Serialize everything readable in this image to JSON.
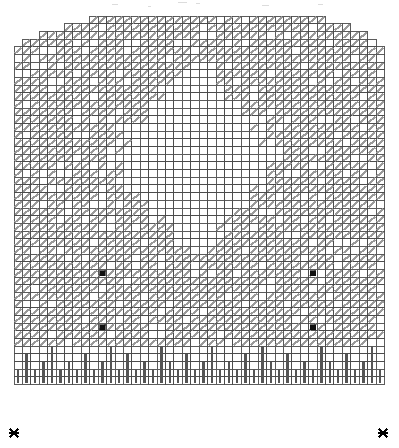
{
  "document": {
    "title": "Knitting Lace Chart",
    "background_color": "#ffffff"
  },
  "legend_symbols": [
    {
      "name": "diagonal-slash",
      "meaning": "slash-symbol",
      "color": "#9a9a9a"
    },
    {
      "name": "black-square",
      "meaning": "filled-marker",
      "color": "#111111"
    },
    {
      "name": "vertical-bar",
      "meaning": "knit-stitch",
      "color": "#555555"
    },
    {
      "name": "x-marker",
      "meaning": "edge-marker",
      "color": "#000000"
    }
  ],
  "chart_data": {
    "type": "heatmap",
    "subtitle": "",
    "xlabel": "",
    "ylabel": "",
    "grid": true,
    "legend_position": "none",
    "columns": 44,
    "rows": 48,
    "cell_width": 8.42,
    "cell_height": 7.68,
    "origin_x": 14,
    "origin_y": 16,
    "categories": [],
    "values": [],
    "colors": {
      "cell_fill": "#ffffff",
      "cell_stroke": "#4a4a4a",
      "slash": "#9a9a9a",
      "black_marker": "#111111",
      "knit_bar": "#555555",
      "x_marker": "#000000"
    },
    "row_extents": [
      {
        "row": 0,
        "start_col": 9,
        "end_col": 36
      },
      {
        "row": 1,
        "start_col": 6,
        "end_col": 39
      },
      {
        "row": 2,
        "start_col": 3,
        "end_col": 41
      },
      {
        "row": 3,
        "start_col": 1,
        "end_col": 42
      },
      {
        "row": 4,
        "start_col": 0,
        "end_col": 43
      }
    ],
    "blank_region": {
      "shape": "diamond",
      "center_col": 21,
      "center_row": 18,
      "half_width": 11,
      "half_height": 15,
      "description": "large open diamond with no slash symbols in center of grid"
    },
    "black_markers": [
      {
        "col": 10,
        "row": 33
      },
      {
        "col": 35,
        "row": 33
      },
      {
        "col": 10,
        "row": 40
      },
      {
        "col": 35,
        "row": 40
      }
    ],
    "knit_bar_rows": {
      "start_row": 43,
      "end_row": 47
    },
    "knit_bar_heights": [
      2,
      4,
      2,
      3,
      5,
      2,
      3,
      2,
      4,
      2,
      3,
      5,
      2,
      4,
      2,
      3,
      2,
      5,
      3,
      2,
      4,
      2,
      3,
      5,
      2,
      3,
      2,
      4,
      2,
      5,
      3,
      2,
      4,
      2,
      3,
      2,
      5,
      3,
      2,
      4,
      2,
      3,
      5,
      2
    ],
    "x_markers": [
      {
        "x": 14,
        "y": 433,
        "position": "bottom-left"
      },
      {
        "x": 383,
        "y": 433,
        "position": "bottom-right"
      }
    ]
  }
}
